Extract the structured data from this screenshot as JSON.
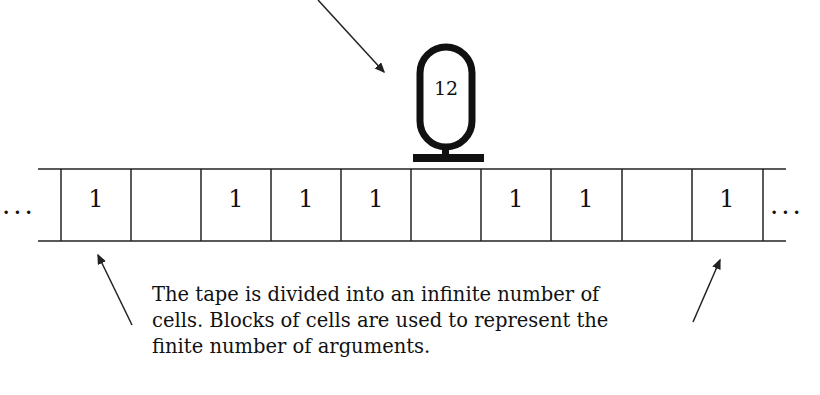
{
  "diagram": {
    "head": {
      "label": "12"
    },
    "tape": {
      "left_ellipsis": "...",
      "right_ellipsis": "...",
      "cells": [
        "1",
        "",
        "1",
        "1",
        "1",
        "",
        "1",
        "1",
        "",
        "1"
      ]
    },
    "caption": {
      "lines": [
        "The tape is divided into an infinite number of",
        "cells. Blocks of cells are used to represent the",
        "finite number of arguments."
      ]
    }
  }
}
